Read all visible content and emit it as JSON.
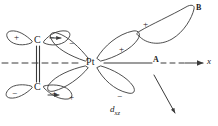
{
  "figure": {
    "background_color": "#ffffff",
    "stroke_color": "#3a3a3a",
    "text_color": "#1a1a1a",
    "width": 218,
    "height": 126
  },
  "atoms": {
    "metal": {
      "label": "Pt",
      "x": 92,
      "y": 63
    },
    "carbon_top": {
      "label": "C",
      "x": 38,
      "y": 41
    },
    "carbon_bottom": {
      "label": "C",
      "x": 38,
      "y": 87
    }
  },
  "orbital_label": {
    "base": "d",
    "subscript": "xz",
    "full": "dxz",
    "x": 112,
    "y": 110
  },
  "axis": {
    "label": "x",
    "label_x": 208,
    "label_y": 63,
    "arrow_direction": "right"
  },
  "points": [
    {
      "name": "point-a",
      "label": "A",
      "x": 155,
      "y": 63
    },
    {
      "name": "point-b",
      "label": "B",
      "x": 198,
      "y": 10
    }
  ],
  "lobes": [
    {
      "name": "lobe-pt-upper-left",
      "sign": "−",
      "sign_x": 72,
      "sign_y": 44
    },
    {
      "name": "lobe-pt-upper-right",
      "sign": "+",
      "sign_x": 122,
      "sign_y": 50
    },
    {
      "name": "lobe-pt-lower-left",
      "sign": "+",
      "sign_x": 72,
      "sign_y": 98
    },
    {
      "name": "lobe-pt-lower-right",
      "sign": "−",
      "sign_x": 120,
      "sign_y": 97
    },
    {
      "name": "lobe-carbon-top-left",
      "sign": "+",
      "sign_x": 25,
      "sign_y": 43
    },
    {
      "name": "lobe-carbon-top-right",
      "sign": "−",
      "sign_x": 52,
      "sign_y": 42
    },
    {
      "name": "lobe-carbon-bottom-left",
      "sign": "−",
      "sign_x": 23,
      "sign_y": 99
    },
    {
      "name": "lobe-carbon-bottom-right",
      "sign": "+",
      "sign_x": 55,
      "sign_y": 99
    },
    {
      "name": "lobe-ligand-b",
      "sign": "+",
      "sign_x": 146,
      "sign_y": 25
    }
  ],
  "bonds": {
    "carbon_double_bond": {
      "type": "double",
      "orientation": "vertical"
    }
  },
  "arrows": {
    "x_axis_arrow": {
      "label": "x-axis-arrow"
    },
    "diagonal_arrow": {
      "label": "rotation-direction-arrow"
    },
    "small_arrow_top": {
      "label": "small-arrow-top"
    },
    "small_arrow_bottom": {
      "label": "small-arrow-bottom"
    }
  }
}
